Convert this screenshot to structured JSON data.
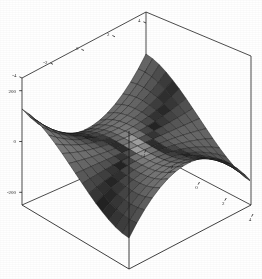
{
  "figure": {
    "kind": "3d-surface-plot",
    "style": "wireframe-box grayscale mesh",
    "background_color": "#ffffff",
    "line_color": "#1e1e1e",
    "mesh_light_color": "#c9c9c9",
    "mesh_dark_color": "#3a3a3a"
  },
  "chart_data": {
    "type": "surface",
    "title": "",
    "xlabel": "",
    "ylabel": "",
    "zlabel": "",
    "grid": false,
    "legend": "none",
    "box": true,
    "function": "z = x^3 - 3*x*y^2",
    "xlim": [
      -4,
      4
    ],
    "ylim": [
      -4,
      4
    ],
    "zlim": [
      -250,
      250
    ],
    "x_ticks": [
      -4,
      -2,
      0,
      2,
      4
    ],
    "x_tick_labels": [
      "-4",
      "-2",
      "0",
      "2",
      "4"
    ],
    "y_ticks": [
      -4,
      -2,
      0,
      2,
      4
    ],
    "y_tick_labels": [
      "-4",
      "-2",
      "0",
      "2",
      "4"
    ],
    "z_ticks": [
      200,
      0,
      -200
    ],
    "z_tick_labels": [
      "200",
      "0",
      "-200"
    ],
    "mesh_steps_x": 16,
    "mesh_steps_y": 16,
    "view": {
      "azimuth": -42,
      "elevation": 22
    }
  },
  "axes": {
    "y_axis": {
      "name": "y-axis (upper left edge)",
      "ticks": [
        "-4",
        "-2",
        "0",
        "2",
        "4"
      ]
    },
    "x_axis": {
      "name": "x-axis (lower front edge)",
      "ticks": [
        "-4",
        "-2",
        "0",
        "2",
        "4"
      ]
    },
    "z_axis": {
      "name": "z-axis (left vertical edge)",
      "ticks": [
        "200",
        "0",
        "-200"
      ]
    }
  }
}
